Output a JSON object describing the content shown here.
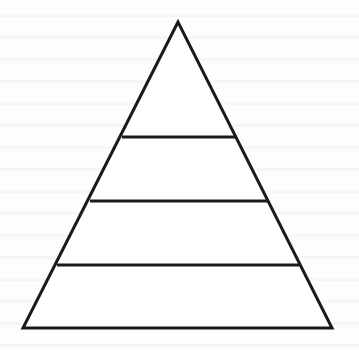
{
  "diagram": {
    "type": "pyramid",
    "levels": 4,
    "labels": [],
    "stroke_color": "#1a1a1a",
    "fill_color": "#ffffff",
    "background_color": "#fdfdfd",
    "stroke_width": 3,
    "geometry": {
      "apex": [
        178,
        22
      ],
      "base_left": [
        23,
        328
      ],
      "base_right": [
        332,
        328
      ],
      "dividers": [
        {
          "y": 137,
          "x1": 122,
          "x2": 236
        },
        {
          "y": 201,
          "x1": 90,
          "x2": 268
        },
        {
          "y": 265,
          "x1": 57,
          "x2": 299
        }
      ]
    }
  }
}
